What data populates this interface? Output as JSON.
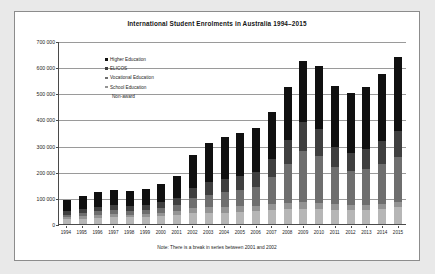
{
  "chart_data": {
    "type": "bar",
    "subtype": "stacked-column",
    "title": "International Student Enrolments in Australia 1994–2015",
    "xlabel": "",
    "ylabel": "",
    "ylim": [
      0,
      700000
    ],
    "ytick_values": [
      0,
      100000,
      200000,
      300000,
      400000,
      500000,
      600000,
      700000
    ],
    "ytick_labels": [
      "0",
      "100 000",
      "200 000",
      "300 000",
      "400 000",
      "500 000",
      "600 000",
      "700 000"
    ],
    "grid": true,
    "legend_position": "inside-upper-left",
    "categories": [
      "1994",
      "1995",
      "1996",
      "1997",
      "1998",
      "1999",
      "2000",
      "2001",
      "2002",
      "2003",
      "2004",
      "2005",
      "2006",
      "2007",
      "2008",
      "2009",
      "2010",
      "2011",
      "2012",
      "2013",
      "2014",
      "2015"
    ],
    "series": [
      {
        "name": "Higher Education",
        "color": "#101010",
        "values": [
          42000,
          48000,
          55000,
          58000,
          56000,
          60000,
          70000,
          86000,
          126000,
          152000,
          162000,
          167000,
          168000,
          179000,
          202000,
          233000,
          243000,
          232000,
          230000,
          237000,
          257000,
          285000
        ]
      },
      {
        "name": "ELICOS",
        "color": "#3f3f3f",
        "values": [
          14000,
          16000,
          18000,
          19000,
          18000,
          19000,
          22000,
          26000,
          40000,
          47000,
          50000,
          54000,
          58000,
          71000,
          94000,
          114000,
          103000,
          78000,
          71000,
          78000,
          88000,
          98000
        ]
      },
      {
        "name": "Vocational Education",
        "color": "#6e6e6e",
        "values": [
          11000,
          13000,
          15000,
          16000,
          15000,
          16000,
          19000,
          23000,
          38000,
          48000,
          55000,
          61000,
          72000,
          102000,
          147000,
          192000,
          177000,
          143000,
          130000,
          137000,
          153000,
          172000
        ]
      },
      {
        "name": "School Education",
        "color": "#949494",
        "values": [
          7000,
          9000,
          10000,
          11000,
          10000,
          11000,
          13000,
          15000,
          19000,
          21000,
          22000,
          22000,
          22000,
          24000,
          26000,
          27000,
          25000,
          22000,
          20000,
          19000,
          19000,
          21000
        ]
      },
      {
        "name": "Non-award",
        "color": "#b6b6b6",
        "values": [
          18000,
          21000,
          24000,
          26000,
          26000,
          27000,
          29000,
          35000,
          42000,
          43000,
          44000,
          46000,
          48000,
          52000,
          56000,
          59000,
          57000,
          53000,
          52000,
          54000,
          58000,
          64000
        ]
      }
    ],
    "totals": [
      92000,
      107000,
      122000,
      130000,
      125000,
      133000,
      153000,
      185000,
      265000,
      311000,
      333000,
      350000,
      368000,
      428000,
      525000,
      625000,
      605000,
      528000,
      503000,
      525000,
      575000,
      640000
    ],
    "note": "Note: There is a break in series between 2001 and 2002"
  },
  "legend": {
    "entries": [
      {
        "label": "Higher Education"
      },
      {
        "label": "ELICOS"
      },
      {
        "label": "Vocational Education"
      },
      {
        "label": "School Education"
      },
      {
        "label": "Non-award"
      }
    ]
  }
}
